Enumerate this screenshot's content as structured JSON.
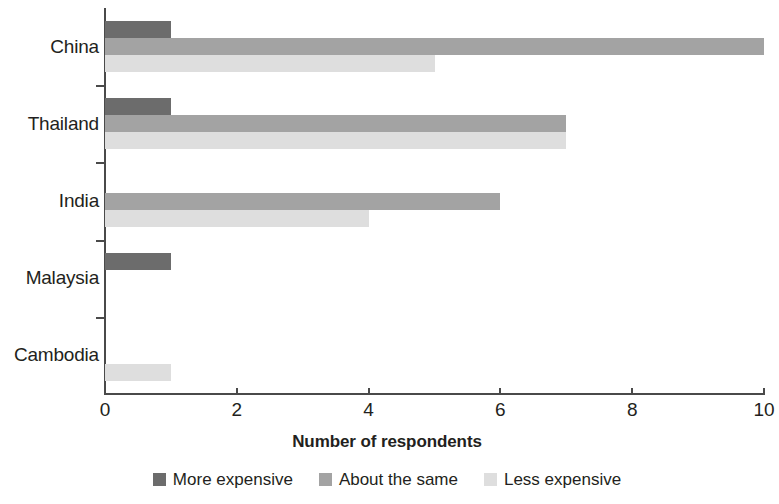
{
  "chart_data": {
    "type": "bar",
    "orientation": "horizontal",
    "grouped": true,
    "title": "",
    "xlabel": "Number of respondents",
    "ylabel": "",
    "xlim": [
      0,
      10
    ],
    "xticks": [
      0,
      2,
      4,
      6,
      8,
      10
    ],
    "xtick_labels": [
      "0",
      "2",
      "4",
      "6",
      "8",
      "10"
    ],
    "grid": false,
    "legend_position": "bottom",
    "categories": [
      "China",
      "Thailand",
      "India",
      "Malaysia",
      "Cambodia"
    ],
    "series": [
      {
        "name": "More expensive",
        "color": "#6c6c6c",
        "values": [
          1,
          1,
          0,
          1,
          0
        ]
      },
      {
        "name": "About the same",
        "color": "#a3a3a3",
        "values": [
          10,
          7,
          6,
          0,
          0
        ]
      },
      {
        "name": "Less expensive",
        "color": "#dedede",
        "values": [
          5,
          7,
          4,
          0,
          1
        ]
      }
    ]
  },
  "legend": {
    "items": [
      {
        "label": "More expensive",
        "color": "#6c6c6c"
      },
      {
        "label": "About the same",
        "color": "#a3a3a3"
      },
      {
        "label": "Less expensive",
        "color": "#dedede"
      }
    ]
  },
  "axis": {
    "x_title": "Number of respondents"
  }
}
